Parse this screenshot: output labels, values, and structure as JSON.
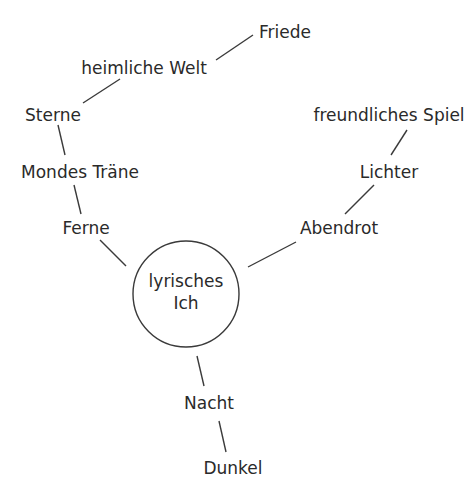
{
  "diagram": {
    "type": "mind-map",
    "line_color": "#3a3a3a",
    "text_color": "#2a2a2a",
    "center": {
      "line1": "lyrisches",
      "line2": "Ich",
      "cx": 186,
      "cy": 294,
      "r": 53
    },
    "nodes": [
      {
        "id": "friede",
        "label": "Friede",
        "x": 285,
        "y": 32
      },
      {
        "id": "heimliche-welt",
        "label": "heimliche Welt",
        "x": 144,
        "y": 68
      },
      {
        "id": "sterne",
        "label": "Sterne",
        "x": 53,
        "y": 115
      },
      {
        "id": "mondes-traene",
        "label": "Mondes Träne",
        "x": 80,
        "y": 172
      },
      {
        "id": "ferne",
        "label": "Ferne",
        "x": 86,
        "y": 228
      },
      {
        "id": "freundliches-spiel",
        "label": "freundliches Spiel",
        "x": 389,
        "y": 115
      },
      {
        "id": "lichter",
        "label": "Lichter",
        "x": 389,
        "y": 172
      },
      {
        "id": "abendrot",
        "label": "Abendrot",
        "x": 339,
        "y": 228
      },
      {
        "id": "nacht",
        "label": "Nacht",
        "x": 209,
        "y": 403
      },
      {
        "id": "dunkel",
        "label": "Dunkel",
        "x": 233,
        "y": 468
      }
    ],
    "edges": [
      {
        "from": "heimliche-welt",
        "to": "friede",
        "x1": 216,
        "y1": 60,
        "x2": 253,
        "y2": 35
      },
      {
        "from": "sterne",
        "to": "heimliche-welt",
        "x1": 83,
        "y1": 103,
        "x2": 120,
        "y2": 79
      },
      {
        "from": "sterne",
        "to": "mondes-traene",
        "x1": 58,
        "y1": 125,
        "x2": 65,
        "y2": 155
      },
      {
        "from": "mondes-traene",
        "to": "ferne",
        "x1": 74,
        "y1": 185,
        "x2": 81,
        "y2": 214
      },
      {
        "from": "ferne",
        "to": "center",
        "x1": 100,
        "y1": 240,
        "x2": 126,
        "y2": 266
      },
      {
        "from": "freundliches-spiel",
        "to": "lichter",
        "x1": 407,
        "y1": 130,
        "x2": 391,
        "y2": 155
      },
      {
        "from": "lichter",
        "to": "abendrot",
        "x1": 374,
        "y1": 185,
        "x2": 345,
        "y2": 214
      },
      {
        "from": "abendrot",
        "to": "center",
        "x1": 296,
        "y1": 242,
        "x2": 248,
        "y2": 267
      },
      {
        "from": "center",
        "to": "nacht",
        "x1": 197,
        "y1": 356,
        "x2": 204,
        "y2": 386
      },
      {
        "from": "nacht",
        "to": "dunkel",
        "x1": 219,
        "y1": 421,
        "x2": 226,
        "y2": 452
      }
    ]
  }
}
